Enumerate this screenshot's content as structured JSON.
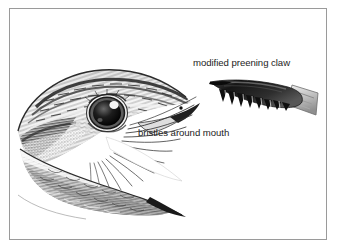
{
  "figure": {
    "frame_border_color": "#9a9a9a",
    "background_color": "#ffffff",
    "ink_color": "#1c1c1c"
  },
  "labels": {
    "preening_claw": "modified preening claw",
    "bristles": "bristles around mouth"
  },
  "illustration": {
    "subject": "nightjar head in profile with gaping mouth",
    "bird_head_name": "bird-head-illustration",
    "claw_name": "preening-claw-illustration",
    "eye_highlight_color": "#ffffff",
    "plumage_tone": "#6e6e6e",
    "claw_tone": "#2a2a2a",
    "claw_base_tone": "#c8c8c8"
  },
  "caption": {
    "partial_text": ""
  }
}
